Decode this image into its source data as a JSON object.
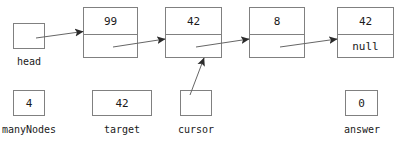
{
  "diagram": {
    "kind": "linked-list-memory-diagram",
    "stroke_color": "#808080",
    "text_color": "#1a1a1a",
    "arrow_color": "#333333"
  },
  "nodes": [
    {
      "data": "99",
      "link": ""
    },
    {
      "data": "42",
      "link": ""
    },
    {
      "data": "8",
      "link": ""
    },
    {
      "data": "42",
      "link": "null"
    }
  ],
  "pointers": [
    {
      "name": "head",
      "value": ""
    },
    {
      "name": "cursor",
      "value": ""
    }
  ],
  "variables": [
    {
      "name": "manyNodes",
      "value": "4"
    },
    {
      "name": "target",
      "value": "42"
    },
    {
      "name": "answer",
      "value": "0"
    }
  ]
}
